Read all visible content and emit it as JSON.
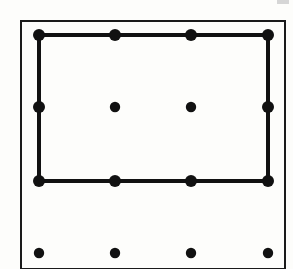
{
  "figure": {
    "title": "Rectangular frame with inner rectangle and twelve node markers",
    "canvas": {
      "width": 293,
      "height": 269,
      "background": "#fdfdfb"
    },
    "outer_frame": {
      "name": "outer-border-rectangle",
      "x": 21,
      "y": 21,
      "width": 264,
      "height": 248,
      "stroke": "#1a1a1a",
      "stroke_width": 2,
      "fill": "none",
      "clipped_at_bottom": true
    },
    "inner_rectangle": {
      "name": "inner-bold-rectangle",
      "x": 39,
      "y": 35,
      "width": 229,
      "height": 146,
      "stroke": "#111111",
      "stroke_width": 4,
      "fill": "none"
    },
    "grid": {
      "columns_x": [
        39,
        115,
        191,
        268
      ],
      "rows_y": [
        35,
        107,
        181,
        253
      ],
      "column_count": 4,
      "row_count": 4
    },
    "nodes": [
      {
        "id": "n1",
        "label": "top-left-corner",
        "x": 39,
        "y": 35,
        "on_rectangle": true,
        "row": 1,
        "col": 1
      },
      {
        "id": "n2",
        "label": "top-edge-mid-left",
        "x": 115,
        "y": 35,
        "on_rectangle": true,
        "row": 1,
        "col": 2
      },
      {
        "id": "n3",
        "label": "top-edge-mid-right",
        "x": 191,
        "y": 35,
        "on_rectangle": true,
        "row": 1,
        "col": 3
      },
      {
        "id": "n4",
        "label": "top-right-corner",
        "x": 268,
        "y": 35,
        "on_rectangle": true,
        "row": 1,
        "col": 4
      },
      {
        "id": "n5",
        "label": "left-edge-middle",
        "x": 39,
        "y": 107,
        "on_rectangle": true,
        "row": 2,
        "col": 1
      },
      {
        "id": "n6",
        "label": "interior-mid-left",
        "x": 115,
        "y": 107,
        "on_rectangle": false,
        "row": 2,
        "col": 2
      },
      {
        "id": "n7",
        "label": "interior-mid-right",
        "x": 191,
        "y": 107,
        "on_rectangle": false,
        "row": 2,
        "col": 3
      },
      {
        "id": "n8",
        "label": "right-edge-middle",
        "x": 268,
        "y": 107,
        "on_rectangle": true,
        "row": 2,
        "col": 4
      },
      {
        "id": "n9",
        "label": "bottom-left-corner",
        "x": 39,
        "y": 181,
        "on_rectangle": true,
        "row": 3,
        "col": 1
      },
      {
        "id": "n10",
        "label": "bottom-edge-mid-left",
        "x": 115,
        "y": 181,
        "on_rectangle": true,
        "row": 3,
        "col": 2
      },
      {
        "id": "n11",
        "label": "bottom-edge-mid-right",
        "x": 191,
        "y": 181,
        "on_rectangle": true,
        "row": 3,
        "col": 3
      },
      {
        "id": "n12",
        "label": "bottom-right-corner",
        "x": 268,
        "y": 181,
        "on_rectangle": true,
        "row": 3,
        "col": 4
      },
      {
        "id": "n13",
        "label": "outside-row-col1",
        "x": 39,
        "y": 253,
        "on_rectangle": false,
        "row": 4,
        "col": 1
      },
      {
        "id": "n14",
        "label": "outside-row-col2",
        "x": 115,
        "y": 253,
        "on_rectangle": false,
        "row": 4,
        "col": 2
      },
      {
        "id": "n15",
        "label": "outside-row-col3",
        "x": 191,
        "y": 253,
        "on_rectangle": false,
        "row": 4,
        "col": 3
      },
      {
        "id": "n16",
        "label": "outside-row-col4",
        "x": 268,
        "y": 253,
        "on_rectangle": false,
        "row": 4,
        "col": 4
      }
    ],
    "node_style": {
      "radius_on_rectangle": 6.0,
      "radius_free": 5.2,
      "fill": "#111111"
    },
    "artifact": {
      "name": "scan-artifact-top-right",
      "x": 277,
      "y": 0,
      "width": 12,
      "height": 4,
      "fill": "#cfcfcf"
    }
  }
}
